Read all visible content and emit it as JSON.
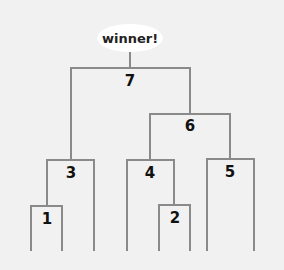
{
  "diagram": {
    "type": "tournament-bracket",
    "winner_label": "winner!",
    "line_color": "#8a8a8a",
    "background": "#f1f1f1",
    "nodes": [
      {
        "id": "1",
        "label": "1"
      },
      {
        "id": "2",
        "label": "2"
      },
      {
        "id": "3",
        "label": "3"
      },
      {
        "id": "4",
        "label": "4"
      },
      {
        "id": "5",
        "label": "5"
      },
      {
        "id": "6",
        "label": "6"
      },
      {
        "id": "7",
        "label": "7"
      }
    ],
    "edges": [
      {
        "parent": "7",
        "children": [
          "3",
          "6"
        ]
      },
      {
        "parent": "6",
        "children": [
          "4",
          "5"
        ]
      },
      {
        "parent": "3",
        "children": [
          "1",
          "leaf"
        ]
      },
      {
        "parent": "4",
        "children": [
          "leaf",
          "2"
        ]
      },
      {
        "parent": "5",
        "children": [
          "leaf",
          "leaf"
        ]
      },
      {
        "parent": "1",
        "children": [
          "leaf",
          "leaf"
        ]
      },
      {
        "parent": "2",
        "children": [
          "leaf",
          "leaf"
        ]
      }
    ],
    "leaf_count": 8
  }
}
